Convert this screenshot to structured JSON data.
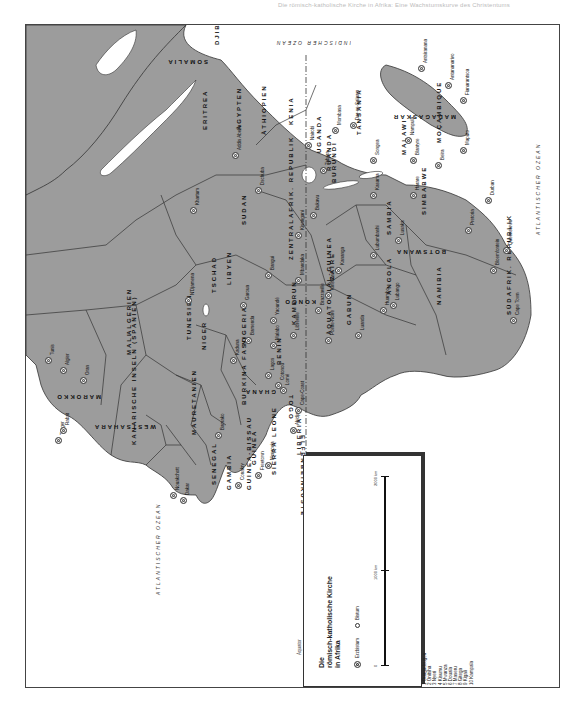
{
  "page": {
    "running_head": "Die römisch-katholische Kirche in Afrika: Eine Wachstumskurve des Christentums"
  },
  "legend": {
    "title_lines": [
      "Die",
      "römisch-katholische Kirche",
      "in Afrika"
    ],
    "erzbistum_label": "Erzbistum",
    "bistum_label": "Bistum",
    "scale": {
      "zero": "0",
      "mid": "1000 km",
      "max": "2000 km"
    },
    "equator_label": "Äquator"
  },
  "numbered_key": [
    {
      "num": "1",
      "name": "Ouagadougou"
    },
    {
      "num": "2",
      "name": "Onitsha"
    },
    {
      "num": "3",
      "name": "Nyeri"
    },
    {
      "num": "4",
      "name": "Kisumu"
    },
    {
      "num": "5",
      "name": "Mwanza"
    },
    {
      "num": "6",
      "name": "Douala"
    },
    {
      "num": "7",
      "name": "Maseru"
    },
    {
      "num": "8",
      "name": "Gitega"
    },
    {
      "num": "9",
      "name": "Kigali"
    },
    {
      "num": "10",
      "name": "Kampala"
    }
  ],
  "oceans": [
    {
      "id": "indian",
      "text": "INDISCHER OZEAN"
    },
    {
      "id": "atlantic-north",
      "text": "ATLANTISCHER OZEAN"
    },
    {
      "id": "atlantic-south",
      "text": "ATLANTISCHER OZEAN"
    }
  ],
  "countries": [
    "SOMALIA",
    "DJIBOUTI",
    "ERITREA",
    "ÄTHIOPIEN",
    "KENIA",
    "TANSANIA",
    "MADAGASKAR",
    "MALAWI",
    "MOÇAMBIQUE",
    "UGANDA",
    "RUANDA",
    "BURUNDI",
    "SUDAN",
    "ÄGYPTEN",
    "LIBYEN",
    "TUNESIEN",
    "ALGERIEN",
    "MAROKKO",
    "WESTSAHARA",
    "MAURETANIEN",
    "MALI",
    "NIGER",
    "TSCHAD",
    "ZENTRALAFRIK. REPUBLIK",
    "ZAIRE",
    "KONGO",
    "GABUN",
    "ÄQUATORIAL-GUINEA",
    "KAMERUN",
    "NIGERIA",
    "BENIN",
    "TOGO",
    "GHANA",
    "BURKINA FASO",
    "ELFENBEINKÜSTE",
    "LIBERIA",
    "SIERRA LEONE",
    "GUINEA",
    "GUINEA-BISSAU",
    "GAMBIA",
    "SENEGAL",
    "ANGOLA",
    "SAMBIA",
    "SIMBABWE",
    "NAMIBIA",
    "BOTSWANA",
    "SÜDAFRIK. REPUBLIK",
    "KANARISCHE INSELN (SPANIEN)"
  ],
  "cities": [
    "Antsiranana",
    "Antananarivo",
    "Fianarantsoa",
    "Addis Abeba",
    "Nairobi",
    "Mombasa",
    "Dar-es-Salaam",
    "Tabora",
    "Songea",
    "Nampula",
    "Blantyre",
    "Beira",
    "Maputo",
    "Durban",
    "Pretoria",
    "Bloemfontein",
    "Queenstown",
    "Cape Town",
    "Harare",
    "Kasama",
    "Lusaka",
    "Lubumbashi",
    "Kisangani",
    "Bukavu",
    "Mbandaka",
    "Kananga",
    "Kinshasa",
    "Brazzaville",
    "Pointe-Noire",
    "Luanda",
    "Huambo",
    "Lubango",
    "Libreville",
    "Malabo",
    "Yaoundé",
    "Bamenda",
    "Garoua",
    "Bangui",
    "N'Djamena",
    "Khartum",
    "Dschuba",
    "Kaduna",
    "Lagos",
    "Cotonou",
    "Lomé",
    "Cape-Coast",
    "Abidjan",
    "Monrovia",
    "Freetown",
    "Conakry",
    "Bamako",
    "Dakar",
    "Nouakchott",
    "Rabat",
    "Tanger",
    "Oran",
    "Algier",
    "Tunis"
  ]
}
